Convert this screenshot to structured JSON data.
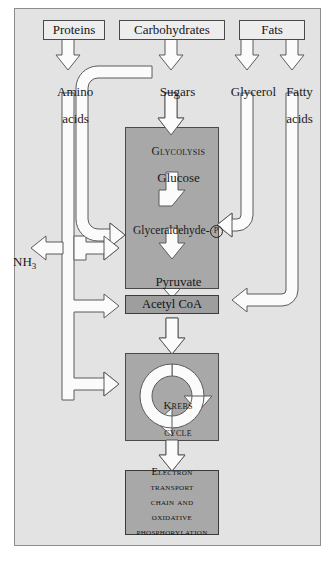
{
  "figure": {
    "frame_color": "#e3e3e3",
    "border_color": "#8d8d8d"
  },
  "sources": {
    "proteins": "Proteins",
    "carbohydrates": "Carbohydrates",
    "fats": "Fats"
  },
  "intermediates": {
    "amino_acids_line1": "Amino",
    "amino_acids_line2": "acids",
    "sugars": "Sugars",
    "glycerol": "Glycerol",
    "fatty_acids_line1": "Fatty",
    "fatty_acids_line2": "acids",
    "ammonia": "NH",
    "ammonia_sub": "3"
  },
  "glycolysis": {
    "heading": "Glycolysis",
    "glucose": "Glucose",
    "glyceraldehyde": "Glyceraldehyde-",
    "glyceraldehyde_phosphate": "P",
    "pyruvate": "Pyruvate",
    "fill": "#a8a8a8"
  },
  "acetyl_coa": {
    "label": "Acetyl CoA",
    "fill": "#9e9e9e"
  },
  "krebs": {
    "line1": "Krebs",
    "line2": "cycle",
    "fill": "#a8a8a8"
  },
  "electron_transport": {
    "lines": [
      "Electron",
      "transport",
      "chain and",
      "oxidative",
      "phosphorylation"
    ],
    "fill": "#a8a8a8"
  },
  "arrows": {
    "fill": "#fbfbfb",
    "stroke": "#5b5b5b"
  }
}
